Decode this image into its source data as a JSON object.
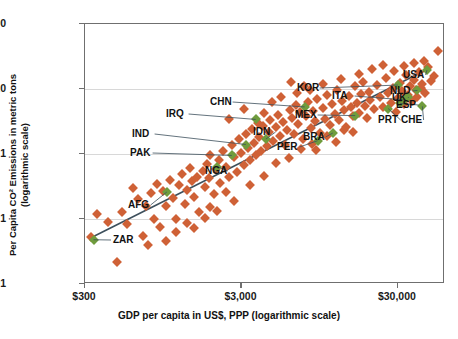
{
  "chart_data": {
    "type": "scatter",
    "title": "",
    "xlabel": "GDP per capita in US$, PPP (logarithmic scale)",
    "ylabel": "Per Capita CO² Emissions in metric tons (logarithmic scale)",
    "ylabel_line1": "Per Capita CO² Emissions in metric tons",
    "ylabel_line2": "(logarithmic scale)",
    "xscale": "log",
    "yscale": "log",
    "xlim": [
      300,
      60000
    ],
    "ylim": [
      0.01,
      100
    ],
    "xticks": [
      300,
      3000,
      30000
    ],
    "xtick_labels": [
      "$300",
      "$3,000",
      "$30,000"
    ],
    "yticks": [
      0.01,
      0.1,
      1,
      10,
      100
    ],
    "ytick_labels": [
      "0.01",
      "0.1",
      "1",
      "10",
      "100"
    ],
    "grid": "horizontal",
    "legend": "none",
    "marker": "diamond",
    "colors": {
      "default": "#cf6136",
      "highlight": "#6f9c3d",
      "trendline": "#3c4f5c",
      "axis": "#6f6f6f",
      "grid": "#d8d8d8"
    },
    "trendline": {
      "x0": 330,
      "y0": 0.052,
      "x1": 47000,
      "y1": 20.5
    },
    "highlighted_points": [
      {
        "code": "ZAR",
        "x": 340,
        "y": 0.048,
        "label_x": 113,
        "label_y": 239
      },
      {
        "code": "AFG",
        "x": 1000,
        "y": 0.26,
        "label_x": 128,
        "label_y": 204
      },
      {
        "code": "NGA",
        "x": 2100,
        "y": 0.64,
        "label_x": 205,
        "label_y": 170
      },
      {
        "code": "PAK",
        "x": 2600,
        "y": 0.95,
        "label_x": 130,
        "label_y": 152
      },
      {
        "code": "IND",
        "x": 3200,
        "y": 1.4,
        "label_x": 132,
        "label_y": 133
      },
      {
        "code": "IDN",
        "x": 4300,
        "y": 1.7,
        "label_x": 253,
        "label_y": 131
      },
      {
        "code": "IRQ",
        "x": 3700,
        "y": 3.4,
        "label_x": 166,
        "label_y": 113
      },
      {
        "code": "CHN",
        "x": 7600,
        "y": 5.3,
        "label_x": 210,
        "label_y": 101
      },
      {
        "code": "PER",
        "x": 9200,
        "y": 1.6,
        "label_x": 277,
        "label_y": 146
      },
      {
        "code": "BRA",
        "x": 11500,
        "y": 2.1,
        "label_x": 303,
        "label_y": 136
      },
      {
        "code": "MEX",
        "x": 16000,
        "y": 3.9,
        "label_x": 295,
        "label_y": 114
      },
      {
        "code": "KOR",
        "x": 30000,
        "y": 11.5,
        "label_x": 297,
        "label_y": 87
      },
      {
        "code": "ITA",
        "x": 33000,
        "y": 6.8,
        "label_x": 332,
        "label_y": 95
      },
      {
        "code": "PRT",
        "x": 26000,
        "y": 5.0,
        "label_x": 378,
        "label_y": 119
      },
      {
        "code": "ESP",
        "x": 31000,
        "y": 6.0,
        "label_x": 396,
        "label_y": 104
      },
      {
        "code": "UK",
        "x": 35000,
        "y": 7.5,
        "label_x": 392,
        "label_y": 97
      },
      {
        "code": "NLD",
        "x": 40000,
        "y": 9.5,
        "label_x": 390,
        "label_y": 90
      },
      {
        "code": "CHE",
        "x": 43000,
        "y": 5.4,
        "label_x": 401,
        "label_y": 119
      },
      {
        "code": "USA",
        "x": 46000,
        "y": 19.5,
        "label_x": 403,
        "label_y": 74
      }
    ],
    "points": [
      {
        "x": 330,
        "y": 0.052
      },
      {
        "x": 360,
        "y": 0.12
      },
      {
        "x": 420,
        "y": 0.09
      },
      {
        "x": 480,
        "y": 0.022
      },
      {
        "x": 520,
        "y": 0.13
      },
      {
        "x": 560,
        "y": 0.085
      },
      {
        "x": 610,
        "y": 0.3
      },
      {
        "x": 650,
        "y": 0.2
      },
      {
        "x": 700,
        "y": 0.055
      },
      {
        "x": 740,
        "y": 0.16
      },
      {
        "x": 790,
        "y": 0.25
      },
      {
        "x": 830,
        "y": 0.1
      },
      {
        "x": 870,
        "y": 0.35
      },
      {
        "x": 900,
        "y": 0.075
      },
      {
        "x": 950,
        "y": 0.27
      },
      {
        "x": 990,
        "y": 0.16
      },
      {
        "x": 1050,
        "y": 0.4
      },
      {
        "x": 1100,
        "y": 0.21
      },
      {
        "x": 1150,
        "y": 0.1
      },
      {
        "x": 1200,
        "y": 0.33
      },
      {
        "x": 1250,
        "y": 0.5
      },
      {
        "x": 1300,
        "y": 0.17
      },
      {
        "x": 1350,
        "y": 0.28
      },
      {
        "x": 1400,
        "y": 0.6
      },
      {
        "x": 1450,
        "y": 0.38
      },
      {
        "x": 1500,
        "y": 0.22
      },
      {
        "x": 1550,
        "y": 0.45
      },
      {
        "x": 1600,
        "y": 0.13
      },
      {
        "x": 1700,
        "y": 0.55
      },
      {
        "x": 1750,
        "y": 0.31
      },
      {
        "x": 1800,
        "y": 0.7
      },
      {
        "x": 1850,
        "y": 0.42
      },
      {
        "x": 1900,
        "y": 0.95
      },
      {
        "x": 2000,
        "y": 0.24
      },
      {
        "x": 2050,
        "y": 0.58
      },
      {
        "x": 2150,
        "y": 0.82
      },
      {
        "x": 2200,
        "y": 0.36
      },
      {
        "x": 2300,
        "y": 1.1
      },
      {
        "x": 2400,
        "y": 0.62
      },
      {
        "x": 2500,
        "y": 0.44
      },
      {
        "x": 2600,
        "y": 1.4
      },
      {
        "x": 2700,
        "y": 0.9
      },
      {
        "x": 2800,
        "y": 0.52
      },
      {
        "x": 2900,
        "y": 1.7
      },
      {
        "x": 3000,
        "y": 1.05
      },
      {
        "x": 3100,
        "y": 0.68
      },
      {
        "x": 3200,
        "y": 2.0
      },
      {
        "x": 3300,
        "y": 1.25
      },
      {
        "x": 3400,
        "y": 0.8
      },
      {
        "x": 3500,
        "y": 2.4
      },
      {
        "x": 3600,
        "y": 1.5
      },
      {
        "x": 3700,
        "y": 0.95
      },
      {
        "x": 3800,
        "y": 3.0
      },
      {
        "x": 3900,
        "y": 1.8
      },
      {
        "x": 4000,
        "y": 1.1
      },
      {
        "x": 4100,
        "y": 2.7
      },
      {
        "x": 4200,
        "y": 4.2
      },
      {
        "x": 4400,
        "y": 1.35
      },
      {
        "x": 4500,
        "y": 2.2
      },
      {
        "x": 4600,
        "y": 3.3
      },
      {
        "x": 4800,
        "y": 1.6
      },
      {
        "x": 5000,
        "y": 2.6
      },
      {
        "x": 5100,
        "y": 4.0
      },
      {
        "x": 5300,
        "y": 1.9
      },
      {
        "x": 5500,
        "y": 3.1
      },
      {
        "x": 5700,
        "y": 1.4
      },
      {
        "x": 5900,
        "y": 2.3
      },
      {
        "x": 6100,
        "y": 4.8
      },
      {
        "x": 6300,
        "y": 3.6
      },
      {
        "x": 6500,
        "y": 2.0
      },
      {
        "x": 6700,
        "y": 5.6
      },
      {
        "x": 6900,
        "y": 2.9
      },
      {
        "x": 7100,
        "y": 4.4
      },
      {
        "x": 7400,
        "y": 1.7
      },
      {
        "x": 7800,
        "y": 3.8
      },
      {
        "x": 8000,
        "y": 6.2
      },
      {
        "x": 8300,
        "y": 2.5
      },
      {
        "x": 8600,
        "y": 4.6
      },
      {
        "x": 8900,
        "y": 3.2
      },
      {
        "x": 9100,
        "y": 7.0
      },
      {
        "x": 9500,
        "y": 2.1
      },
      {
        "x": 9900,
        "y": 5.1
      },
      {
        "x": 10200,
        "y": 3.5
      },
      {
        "x": 10600,
        "y": 8.0
      },
      {
        "x": 11000,
        "y": 2.8
      },
      {
        "x": 11400,
        "y": 5.8
      },
      {
        "x": 11800,
        "y": 4.1
      },
      {
        "x": 12200,
        "y": 9.5
      },
      {
        "x": 12700,
        "y": 3.3
      },
      {
        "x": 13100,
        "y": 6.5
      },
      {
        "x": 13600,
        "y": 4.7
      },
      {
        "x": 14000,
        "y": 2.6
      },
      {
        "x": 14500,
        "y": 7.8
      },
      {
        "x": 15000,
        "y": 5.3
      },
      {
        "x": 15500,
        "y": 3.9
      },
      {
        "x": 16000,
        "y": 11.0
      },
      {
        "x": 16500,
        "y": 6.0
      },
      {
        "x": 17000,
        "y": 4.3
      },
      {
        "x": 17500,
        "y": 8.5
      },
      {
        "x": 18000,
        "y": 13.0
      },
      {
        "x": 18500,
        "y": 5.5
      },
      {
        "x": 19000,
        "y": 3.6
      },
      {
        "x": 19500,
        "y": 9.0
      },
      {
        "x": 20000,
        "y": 6.8
      },
      {
        "x": 21000,
        "y": 4.9
      },
      {
        "x": 22000,
        "y": 11.5
      },
      {
        "x": 23000,
        "y": 7.4
      },
      {
        "x": 24000,
        "y": 5.2
      },
      {
        "x": 25000,
        "y": 15.0
      },
      {
        "x": 26000,
        "y": 8.8
      },
      {
        "x": 27000,
        "y": 6.1
      },
      {
        "x": 28000,
        "y": 10.5
      },
      {
        "x": 29000,
        "y": 4.5
      },
      {
        "x": 30000,
        "y": 7.2
      },
      {
        "x": 31000,
        "y": 12.5
      },
      {
        "x": 32000,
        "y": 9.2
      },
      {
        "x": 33000,
        "y": 5.9
      },
      {
        "x": 34000,
        "y": 16.5
      },
      {
        "x": 35000,
        "y": 8.2
      },
      {
        "x": 36000,
        "y": 11.0
      },
      {
        "x": 37000,
        "y": 6.6
      },
      {
        "x": 38000,
        "y": 14.0
      },
      {
        "x": 39000,
        "y": 9.8
      },
      {
        "x": 40000,
        "y": 7.6
      },
      {
        "x": 41000,
        "y": 18.0
      },
      {
        "x": 42000,
        "y": 10.2
      },
      {
        "x": 43000,
        "y": 12.0
      },
      {
        "x": 45000,
        "y": 8.6
      },
      {
        "x": 47000,
        "y": 22.0
      },
      {
        "x": 49000,
        "y": 13.5
      },
      {
        "x": 51000,
        "y": 16.0
      },
      {
        "x": 54000,
        "y": 38.0
      },
      {
        "x": 2700,
        "y": 0.19
      },
      {
        "x": 3400,
        "y": 0.33
      },
      {
        "x": 4200,
        "y": 0.46
      },
      {
        "x": 5000,
        "y": 0.72
      },
      {
        "x": 6000,
        "y": 0.88
      },
      {
        "x": 7200,
        "y": 1.2
      },
      {
        "x": 8500,
        "y": 1.45
      },
      {
        "x": 1900,
        "y": 0.155
      },
      {
        "x": 2400,
        "y": 0.26
      },
      {
        "x": 1350,
        "y": 0.088
      },
      {
        "x": 1150,
        "y": 0.063
      },
      {
        "x": 990,
        "y": 0.046
      },
      {
        "x": 760,
        "y": 0.04
      },
      {
        "x": 1500,
        "y": 0.072
      },
      {
        "x": 1750,
        "y": 0.105
      },
      {
        "x": 2100,
        "y": 0.135
      },
      {
        "x": 9000,
        "y": 1.15
      },
      {
        "x": 10500,
        "y": 1.9
      },
      {
        "x": 12000,
        "y": 1.55
      },
      {
        "x": 13500,
        "y": 2.3
      },
      {
        "x": 15500,
        "y": 2.15
      },
      {
        "x": 4700,
        "y": 6.3
      },
      {
        "x": 5400,
        "y": 7.5
      },
      {
        "x": 6800,
        "y": 8.6
      },
      {
        "x": 8200,
        "y": 9.8
      },
      {
        "x": 3100,
        "y": 5.0
      },
      {
        "x": 2500,
        "y": 3.4
      },
      {
        "x": 20500,
        "y": 20.0
      },
      {
        "x": 24000,
        "y": 23.5
      },
      {
        "x": 28500,
        "y": 19.0
      },
      {
        "x": 33000,
        "y": 22.5
      },
      {
        "x": 38000,
        "y": 25.0
      },
      {
        "x": 44000,
        "y": 27.0
      },
      {
        "x": 17000,
        "y": 17.0
      },
      {
        "x": 13000,
        "y": 14.5
      },
      {
        "x": 10000,
        "y": 12.0
      },
      {
        "x": 7500,
        "y": 11.0
      },
      {
        "x": 6200,
        "y": 12.8
      }
    ]
  }
}
